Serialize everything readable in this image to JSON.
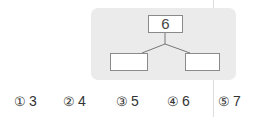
{
  "diagram": {
    "top_value": "6",
    "left_value": "",
    "right_value": ""
  },
  "choices": [
    {
      "marker": "①",
      "value": "3"
    },
    {
      "marker": "②",
      "value": "4"
    },
    {
      "marker": "③",
      "value": "5"
    },
    {
      "marker": "④",
      "value": "6"
    },
    {
      "marker": "⑤",
      "value": "7"
    }
  ]
}
